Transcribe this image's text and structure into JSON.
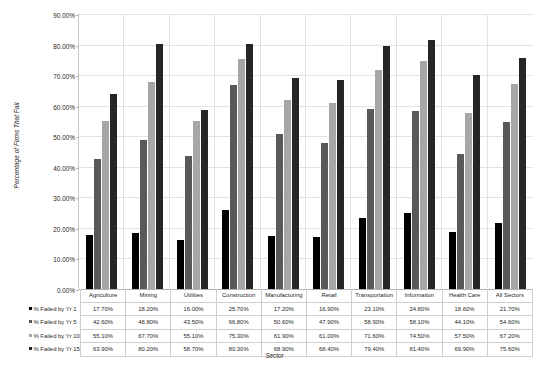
{
  "chart_data": {
    "type": "bar",
    "title": "",
    "xlabel": "Sector",
    "ylabel": "Percentage of Firms That Fail",
    "ylim": [
      0,
      90
    ],
    "ytick_step": 10,
    "ytick_labels": [
      "0.00%",
      "10.00%",
      "20.00%",
      "30.00%",
      "40.00%",
      "50.00%",
      "60.00%",
      "70.00%",
      "80.00%",
      "90.00%"
    ],
    "grid": true,
    "legend_position": "data-table-below",
    "categories": [
      "Agriculture",
      "Mining",
      "Utilities",
      "Construction",
      "Manufacturing",
      "Retail",
      "Transportation",
      "Information",
      "Health Care",
      "All Sectors"
    ],
    "series": [
      {
        "name": "% Failed by Yr 1",
        "color": "#000000",
        "values": [
          17.7,
          18.2,
          16.0,
          25.7,
          17.2,
          16.9,
          23.1,
          24.8,
          18.6,
          21.7
        ],
        "labels": [
          "17.70%",
          "18.20%",
          "16.00%",
          "25.70%",
          "17.20%",
          "16.90%",
          "23.10%",
          "24.80%",
          "18.60%",
          "21.70%"
        ]
      },
      {
        "name": "% Failed by Yr 5",
        "color": "#595959",
        "values": [
          42.6,
          48.8,
          43.5,
          66.8,
          50.6,
          47.9,
          58.9,
          58.1,
          44.1,
          54.6
        ],
        "labels": [
          "42.60%",
          "48.80%",
          "43.50%",
          "66.80%",
          "50.60%",
          "47.90%",
          "58.90%",
          "58.10%",
          "44.10%",
          "54.60%"
        ]
      },
      {
        "name": "% Failed by Yr 10",
        "color": "#a6a6a6",
        "values": [
          55.1,
          67.7,
          55.1,
          75.3,
          61.9,
          61.0,
          71.6,
          74.5,
          57.5,
          67.2
        ],
        "labels": [
          "55.10%",
          "67.70%",
          "55.10%",
          "75.30%",
          "61.90%",
          "61.00%",
          "71.60%",
          "74.50%",
          "57.50%",
          "67.20%"
        ]
      },
      {
        "name": "% Failed by Yr 15",
        "color": "#262626",
        "values": [
          63.9,
          80.2,
          58.7,
          80.3,
          68.9,
          68.4,
          79.4,
          81.4,
          69.9,
          75.6
        ],
        "labels": [
          "63.90%",
          "80.20%",
          "58.70%",
          "80.30%",
          "68.90%",
          "68.40%",
          "79.40%",
          "81.40%",
          "69.90%",
          "75.60%"
        ]
      }
    ]
  }
}
